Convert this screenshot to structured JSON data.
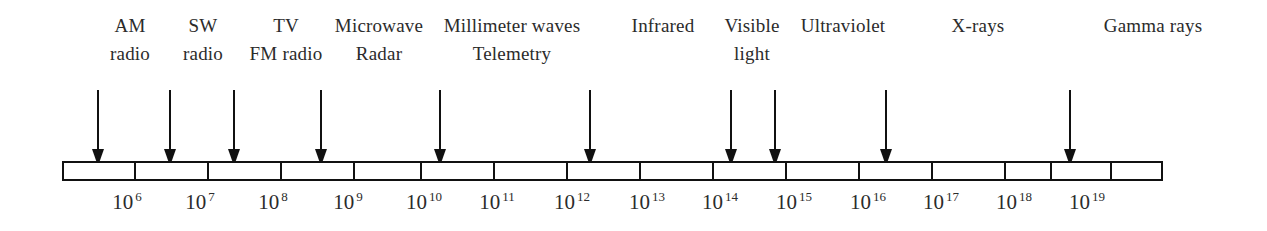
{
  "figure": {
    "ink_color": "#111111",
    "text_color": "#2b2b2b",
    "background_color": "#ffffff"
  },
  "chart_data": {
    "type": "bar",
    "xlabel": "Frequency (Hz)",
    "ylabel": "",
    "grid": false,
    "legend": false,
    "axis": {
      "scale": "log10",
      "start_exponent": 5,
      "end_exponent": 20,
      "segment_count": 16,
      "bar_left_px": 62,
      "bar_right_px": 1163,
      "bar_top_px": 161,
      "bar_height_px": 20,
      "px_per_decade": 68.8
    },
    "tick_labels": [
      {
        "base": "10",
        "exponent": "6",
        "exponent_value": 6,
        "x": 127
      },
      {
        "base": "10",
        "exponent": "7",
        "exponent_value": 7,
        "x": 200
      },
      {
        "base": "10",
        "exponent": "8",
        "exponent_value": 8,
        "x": 273
      },
      {
        "base": "10",
        "exponent": "9",
        "exponent_value": 9,
        "x": 348
      },
      {
        "base": "10",
        "exponent": "10",
        "exponent_value": 10,
        "x": 424
      },
      {
        "base": "10",
        "exponent": "11",
        "exponent_value": 11,
        "x": 497
      },
      {
        "base": "10",
        "exponent": "12",
        "exponent_value": 12,
        "x": 572
      },
      {
        "base": "10",
        "exponent": "13",
        "exponent_value": 13,
        "x": 647
      },
      {
        "base": "10",
        "exponent": "14",
        "exponent_value": 14,
        "x": 720
      },
      {
        "base": "10",
        "exponent": "15",
        "exponent_value": 15,
        "x": 794
      },
      {
        "base": "10",
        "exponent": "16",
        "exponent_value": 16,
        "x": 868
      },
      {
        "base": "10",
        "exponent": "17",
        "exponent_value": 17,
        "x": 941
      },
      {
        "base": "10",
        "exponent": "18",
        "exponent_value": 18,
        "x": 1014
      },
      {
        "base": "10",
        "exponent": "19",
        "exponent_value": 19,
        "x": 1087
      }
    ],
    "dividers_px": [
      134,
      207,
      280,
      353,
      420,
      493,
      566,
      639,
      712,
      785,
      858,
      931,
      1004,
      1050,
      1110
    ],
    "bands": [
      {
        "name": "am-radio",
        "line1": "AM",
        "line2": "radio",
        "label_x": 130,
        "arrow_x": 98,
        "arrow_frequency_exponent": 5.5
      },
      {
        "name": "sw-radio",
        "line1": "SW",
        "line2": "radio",
        "label_x": 203,
        "arrow_x": 170,
        "arrow_frequency_exponent": 6.5
      },
      {
        "name": "tv-fm-radio",
        "line1": "TV",
        "line2": "FM radio",
        "label_x": 286,
        "arrow_x": 234,
        "arrow_frequency_exponent": 7.5
      },
      {
        "name": "microwave-radar",
        "line1": "Microwave",
        "line2": "Radar",
        "label_x": 379,
        "arrow_x": 321,
        "arrow_frequency_exponent": 8.7
      },
      {
        "name": "millimeter-waves-telemetry",
        "line1": "Millimeter waves",
        "line2": "Telemetry",
        "label_x": 512,
        "arrow_x": 440,
        "arrow_frequency_exponent": 10.5
      },
      {
        "name": "infrared",
        "line1": "Infrared",
        "line2": "",
        "label_x": 663,
        "arrow_x": 590,
        "arrow_frequency_exponent": 12.6
      },
      {
        "name": "visible-light",
        "line1": "Visible",
        "line2": "light",
        "label_x": 752,
        "arrow_x": 731,
        "arrow_frequency_exponent": 14.7
      },
      {
        "name": "ultraviolet",
        "line1": "Ultraviolet",
        "line2": "",
        "label_x": 843,
        "arrow_x": 775,
        "arrow_frequency_exponent": 15.3
      },
      {
        "name": "x-rays",
        "line1": "X-rays",
        "line2": "",
        "label_x": 978,
        "arrow_x": 886,
        "arrow_frequency_exponent": 16.9
      },
      {
        "name": "gamma-rays",
        "line1": "Gamma rays",
        "line2": "",
        "label_x": 1153,
        "arrow_x": 1070,
        "arrow_frequency_exponent": 19.5
      }
    ]
  }
}
